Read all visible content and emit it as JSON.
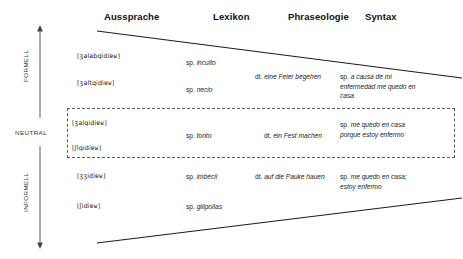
{
  "figure": {
    "columns": [
      {
        "id": "aussprache",
        "label": "Aussprache"
      },
      {
        "id": "lexikon",
        "label": "Lexikon"
      },
      {
        "id": "phraseologie",
        "label": "Phraseologie"
      },
      {
        "id": "syntax",
        "label": "Syntax"
      }
    ],
    "register_axis": {
      "top_label": "FORMELL",
      "middle_label": "NEUTRAL",
      "bottom_label": "INFORMELL"
    },
    "rows": {
      "formal_1": {
        "aussprache": "[ʒalabqidiɐʁ]",
        "lexikon_lang": "sp.",
        "lexikon_term": "inculto",
        "phraseologie_lang": "",
        "phraseologie_term": "",
        "syntax_lang": "",
        "syntax_term": ""
      },
      "formal_2": {
        "aussprache": "[ʒaltqidiɐʁ]",
        "lexikon_lang": "sp.",
        "lexikon_term": "necio",
        "phraseologie_lang": "dt.",
        "phraseologie_term": "eine Feier begehen",
        "syntax_lang": "sp.",
        "syntax_term": "a causa de mi enfermedad me quedo en casa"
      },
      "neutral_1": {
        "aussprache": "[ʒalqidiɐʁ]",
        "lexikon_lang": "",
        "lexikon_term": "",
        "phraseologie_lang": "",
        "phraseologie_term": "",
        "syntax_lang": "",
        "syntax_term": ""
      },
      "neutral_mid": {
        "lexikon_lang": "sp.",
        "lexikon_term": "tonto",
        "phraseologie_lang": "dt.",
        "phraseologie_term": "ein Fest machen",
        "syntax_lang": "sp.",
        "syntax_term": "me quedo en casa porque estoy enfermo"
      },
      "neutral_2": {
        "aussprache": "[ʃlqidiɐʁ]"
      },
      "informal_1": {
        "aussprache": "[ʒʒidiɐʁ]",
        "lexikon_lang": "sp.",
        "lexikon_term": "imbécil",
        "phraseologie_lang": "dt.",
        "phraseologie_term": "auf die Pauke hauen",
        "syntax_lang": "sp.",
        "syntax_term": "me quedo en casa; estoy enfermo"
      },
      "informal_2": {
        "aussprache": "[ʃidiɐʁ]",
        "lexikon_lang": "sp.",
        "lexikon_term": "gilipollas"
      }
    },
    "colors": {
      "ink": "#1a1a1a",
      "line": "#222222",
      "dash": "#5a5a5a",
      "background": "#ffffff"
    }
  }
}
